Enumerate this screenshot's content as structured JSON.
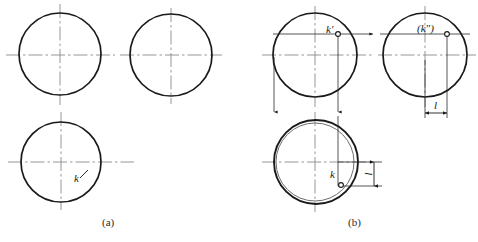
{
  "figure": {
    "type": "technical-drawing",
    "width": 478,
    "height": 242,
    "background_color": "#ffffff",
    "line_color": "#1a1a1a",
    "center_line_color": "#7a7a7a",
    "thin_line_color": "#3a3a3a"
  },
  "captions": {
    "a": "(a)",
    "b": "(b)"
  },
  "panel_a": {
    "name": "panel-a",
    "circles": [
      {
        "name": "front-view-circle",
        "cx": 60,
        "cy": 54,
        "r": 41
      },
      {
        "name": "side-view-circle",
        "cx": 171,
        "cy": 55,
        "r": 41
      },
      {
        "name": "top-view-circle",
        "cx": 61,
        "cy": 162,
        "r": 40
      }
    ],
    "labels": {
      "k0": "k"
    }
  },
  "panel_b": {
    "name": "panel-b",
    "circles": [
      {
        "name": "front-view-circle",
        "cx": 315,
        "cy": 55,
        "r": 42
      },
      {
        "name": "side-view-circle",
        "cx": 425,
        "cy": 55,
        "r": 42
      },
      {
        "name": "top-view-circle-inner",
        "cx": 315,
        "cy": 162,
        "r": 39
      },
      {
        "name": "top-view-circle-outer",
        "cx": 316,
        "cy": 162,
        "r": 42
      }
    ],
    "points": {
      "k_front": {
        "label": "k'",
        "cx": 338,
        "cy": 33
      },
      "k_side": {
        "label": "(k″)",
        "cx": 447,
        "cy": 33
      },
      "k_top": {
        "label": "k",
        "cx": 341,
        "cy": 185
      }
    },
    "dimensions": {
      "horizontal": "l",
      "vertical": "l"
    }
  }
}
